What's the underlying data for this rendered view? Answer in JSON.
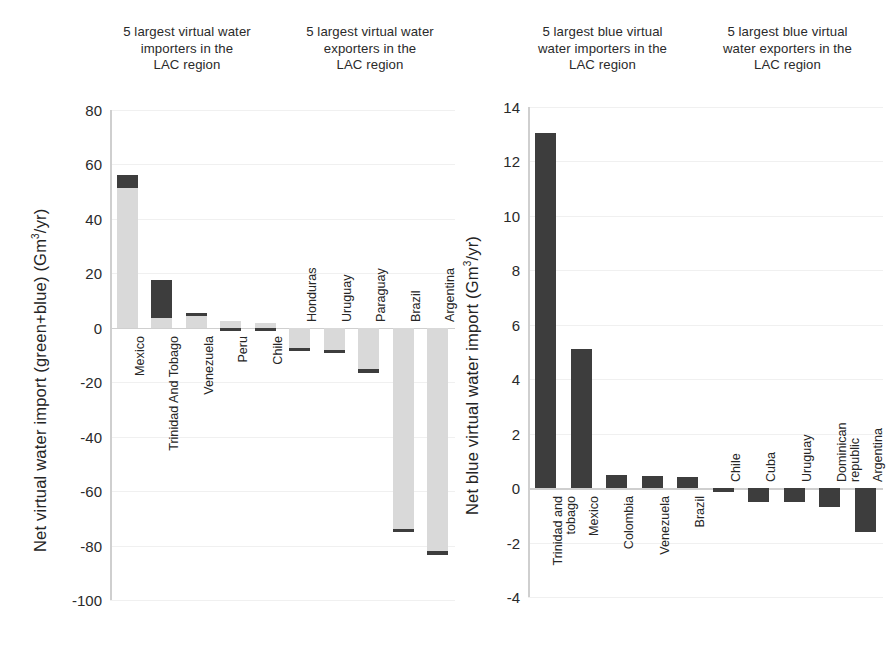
{
  "figure": {
    "background_color": "#ffffff",
    "green_color": "#d9d9d9",
    "blue_color": "#3d3d3d"
  },
  "panels": {
    "left": {
      "axis_label_prefix": "Net virtual water import (green+blue) (Gm",
      "axis_label_exponent": "3",
      "axis_label_suffix": "/yr)",
      "group_titles": {
        "importers": "5 largest virtual water\nimporters in the\nLAC region",
        "exporters": "5 largest virtual water\nexporters in the\nLAC region"
      },
      "ticks": [
        "80",
        "60",
        "40",
        "20",
        "0",
        "-20",
        "-40",
        "-60",
        "-80",
        "-100"
      ]
    },
    "right": {
      "axis_label_prefix": "Net blue virtual water import (Gm",
      "axis_label_exponent": "3",
      "axis_label_suffix": "/yr)",
      "group_titles": {
        "importers": "5 largest blue virtual\nwater importers in the\nLAC region",
        "exporters": "5 largest blue virtual\nwater exporters in the\nLAC region"
      },
      "ticks": [
        "14",
        "12",
        "10",
        "8",
        "6",
        "4",
        "2",
        "0",
        "-2",
        "-4"
      ]
    }
  },
  "chart_data": [
    {
      "type": "bar",
      "id": "net-virtual-water-import-green-blue",
      "title": "5 largest virtual water importers / exporters in the LAC region",
      "xlabel": "",
      "ylabel": "Net virtual water import (green+blue) (Gm3/yr)",
      "ylim": [
        -100,
        80
      ],
      "yticks": [
        80,
        60,
        40,
        20,
        0,
        -20,
        -40,
        -60,
        -80,
        -100
      ],
      "grid": true,
      "stacked": true,
      "series": [
        {
          "name": "green",
          "values": [
            51.5,
            3.7,
            4.4,
            2.6,
            1.6,
            -7.5,
            -8.2,
            -15.0,
            -74.0,
            -82.0
          ]
        },
        {
          "name": "blue",
          "values": [
            4.8,
            13.7,
            1.1,
            -0.5,
            -0.6,
            -0.3,
            -0.8,
            -1.5,
            -0.4,
            -1.6
          ]
        }
      ],
      "categories": [
        "Mexico",
        "Trinidad And Tobago",
        "Venezuela",
        "Peru",
        "Chile",
        "Honduras",
        "Uruguay",
        "Paraguay",
        "Brazil",
        "Argentina"
      ],
      "totals": [
        56.3,
        17.4,
        5.5,
        2.6,
        1.6,
        -7.5,
        -9.0,
        -16.5,
        -74.4,
        -83.6
      ]
    },
    {
      "type": "bar",
      "id": "net-blue-virtual-water-import",
      "title": "5 largest blue virtual water importers / exporters in the LAC region",
      "xlabel": "",
      "ylabel": "Net blue virtual water import (Gm3/yr)",
      "ylim": [
        -4,
        14
      ],
      "yticks": [
        14,
        12,
        10,
        8,
        6,
        4,
        2,
        0,
        -2,
        -4
      ],
      "grid": true,
      "stacked": false,
      "categories": [
        "Trinidad and\ntobago",
        "Mexico",
        "Colombia",
        "Venezuela",
        "Brazil",
        "Chile",
        "Cuba",
        "Uruguay",
        "Dominican republic",
        "Argentina"
      ],
      "values": [
        13.05,
        5.1,
        0.5,
        0.45,
        0.4,
        -0.1,
        -0.5,
        -0.5,
        -0.7,
        -1.6
      ]
    }
  ]
}
